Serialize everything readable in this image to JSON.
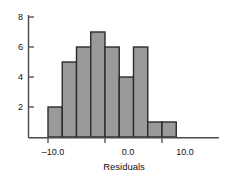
{
  "chart_data": {
    "type": "bar",
    "title": "",
    "subtitle": "",
    "xlabel": "Residuals",
    "ylabel": "",
    "grid": false,
    "legend": false,
    "legend_position": "none",
    "orientation": "vertical",
    "bar_style": "histogram",
    "bin_width": 2.5,
    "bin_edges": [
      -10.0,
      -7.5,
      -5.0,
      -2.5,
      0.0,
      2.5,
      5.0,
      7.5,
      10.0,
      12.5
    ],
    "categories": [
      "-10.0 to -7.5",
      "-7.5 to -5.0",
      "-5.0 to -2.5",
      "-2.5 to 0.0",
      "0.0 to 2.5",
      "2.5 to 5.0",
      "5.0 to 7.5",
      "7.5 to 10.0",
      "10.0 to 12.5"
    ],
    "values": [
      2,
      5,
      6,
      7,
      6,
      4,
      6,
      1,
      1
    ],
    "bin_centers": [
      -8.75,
      -6.25,
      -3.75,
      -1.25,
      1.25,
      3.75,
      6.25,
      8.75,
      11.25
    ],
    "xlim": [
      -12.5,
      13.5
    ],
    "ylim": [
      0,
      8.6
    ],
    "xticks": [
      -10.0,
      0.0,
      10.0
    ],
    "xtick_labels": [
      "–10.0",
      "0.0",
      "10.0"
    ],
    "yticks": [
      2,
      4,
      6,
      8
    ],
    "ytick_labels": [
      "2",
      "4",
      "6",
      "8"
    ],
    "colors": {
      "bar_fill": "#9a9a9a",
      "bar_stroke": "#2b2b2b",
      "axis": "#4a4a4a",
      "text": "#111111",
      "background": "#ffffff"
    }
  },
  "axes": {
    "x_title": "Residuals",
    "y_title": ""
  },
  "labels": {
    "y_8": "8",
    "y_6": "6",
    "y_4": "4",
    "y_2": "2",
    "x_neg10": "–10.0",
    "x_0": "0.0",
    "x_10": "10.0"
  }
}
